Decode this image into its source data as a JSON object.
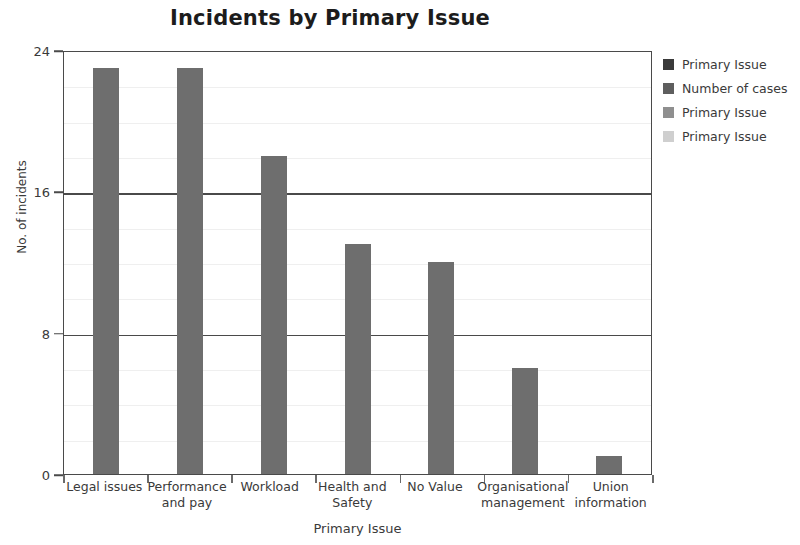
{
  "chart_data": {
    "type": "bar",
    "title": "Incidents by Primary Issue",
    "xlabel": "Primary Issue",
    "ylabel": "No. of incidents",
    "categories": [
      "Legal issues",
      "Performance and pay",
      "Workload",
      "Health and Safety",
      "No Value",
      "Organisational management",
      "Union information"
    ],
    "values": [
      23,
      23,
      18,
      13,
      12,
      6,
      1
    ],
    "ylim": [
      0,
      24
    ],
    "y_ticks": [
      0,
      8,
      16,
      24
    ],
    "y_tick_labels": [
      "0",
      "8",
      "16",
      "24"
    ],
    "minor_tick_step": 2,
    "grid": true,
    "bar_color": "#6e6e6e",
    "legend_position": "right",
    "legend": [
      {
        "label": "Primary Issue",
        "color": "#3a3a3a"
      },
      {
        "label": "Number of cases",
        "color": "#5e5e5e"
      },
      {
        "label": "Primary Issue",
        "color": "#8f8f8f"
      },
      {
        "label": "Primary Issue",
        "color": "#cfcfcf"
      }
    ]
  }
}
